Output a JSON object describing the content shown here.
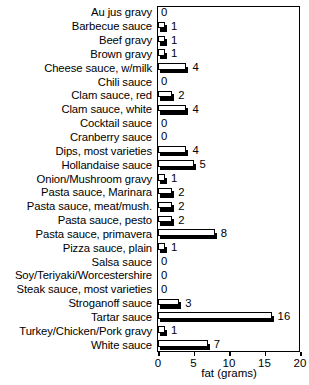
{
  "chart_data": {
    "type": "bar",
    "orientation": "horizontal",
    "title": "",
    "xlabel": "fat (grams)",
    "ylabel": "",
    "xlim": [
      0,
      20
    ],
    "xticks": [
      0,
      5,
      10,
      15,
      20
    ],
    "grid": false,
    "legend": null,
    "value_labels": true,
    "categories": [
      "Au jus gravy",
      "Barbecue sauce",
      "Beef gravy",
      "Brown gravy",
      "Cheese sauce, w/milk",
      "Chili sauce",
      "Clam sauce, red",
      "Clam sauce, white",
      "Cocktail sauce",
      "Cranberry sauce",
      "Dips, most varieties",
      "Hollandaise sauce",
      "Onion/Mushroom gravy",
      "Pasta sauce, Marinara",
      "Pasta sauce, meat/mush.",
      "Pasta sauce, pesto",
      "Pasta sauce, primavera",
      "Pizza sauce, plain",
      "Salsa sauce",
      "Soy/Teriyaki/Worcestershire",
      "Steak sauce, most varieties",
      "Stroganoff sauce",
      "Tartar sauce",
      "Turkey/Chicken/Pork gravy",
      "White sauce"
    ],
    "values": [
      0,
      1,
      1,
      1,
      4,
      0,
      2,
      4,
      0,
      0,
      4,
      5,
      1,
      2,
      2,
      2,
      8,
      1,
      0,
      0,
      0,
      3,
      16,
      1,
      7
    ]
  },
  "style": {
    "bar_face_color": "#ffffff",
    "bar_edge_color": "#000000",
    "bar_shadow_color": "#000000",
    "background_color": "#ffffff",
    "text_color": "#000000"
  }
}
